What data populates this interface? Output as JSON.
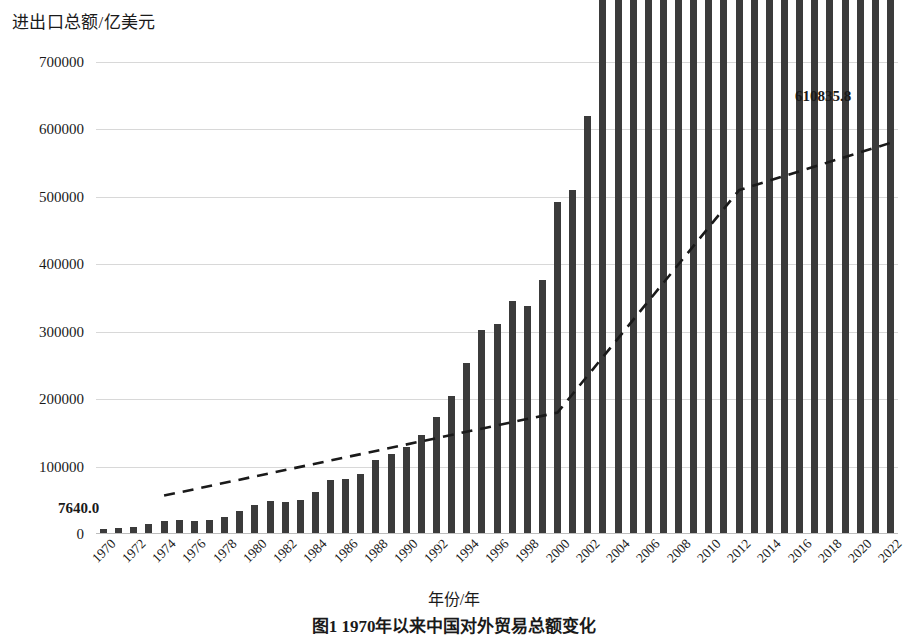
{
  "axis": {
    "y_title": "进出口总额/亿美元",
    "x_title": "年份/年",
    "y_ticks": [
      "0",
      "100000",
      "200000",
      "300000",
      "400000",
      "500000",
      "600000",
      "700000"
    ]
  },
  "annotations": {
    "first_value_label": "7640.0",
    "last_value_label": "610835.8"
  },
  "caption": "图1  1970年以来中国对外贸易总额变化",
  "colors": {
    "bar": "#3b3b3b",
    "trend": "#1a1a1a",
    "grid": "#d8d8d8"
  },
  "chart_data": {
    "type": "bar",
    "title": "",
    "xlabel": "年份/年",
    "ylabel": "进出口总额/亿美元",
    "ylim": [
      0,
      700000
    ],
    "grid": true,
    "legend": "none",
    "categories": [
      "1970",
      "1971",
      "1972",
      "1973",
      "1974",
      "1975",
      "1976",
      "1977",
      "1978",
      "1979",
      "1980",
      "1981",
      "1982",
      "1983",
      "1984",
      "1985",
      "1986",
      "1987",
      "1988",
      "1989",
      "1990",
      "1991",
      "1992",
      "1993",
      "1994",
      "1995",
      "1996",
      "1997",
      "1998",
      "1999",
      "2000",
      "2001",
      "2002",
      "2003",
      "2004",
      "2005",
      "2006",
      "2007",
      "2008",
      "2009",
      "2010",
      "2011",
      "2012",
      "2013",
      "2014",
      "2015",
      "2016",
      "2017",
      "2018",
      "2019",
      "2020",
      "2021",
      "2022"
    ],
    "tick_categories": [
      "1970",
      "1972",
      "1974",
      "1976",
      "1978",
      "1980",
      "1982",
      "1984",
      "1986",
      "1988",
      "1990",
      "1992",
      "1994",
      "1996",
      "1998",
      "2000",
      "2002",
      "2004",
      "2006",
      "2008",
      "2010",
      "2012",
      "2014",
      "2016",
      "2018",
      "2020",
      "2022"
    ],
    "series": [
      {
        "name": "进出口总额",
        "kind": "bar",
        "values": [
          7640,
          8140,
          10000,
          14700,
          19200,
          20100,
          19800,
          21300,
          25500,
          34000,
          43000,
          48600,
          47400,
          49800,
          61900,
          80500,
          81800,
          89500,
          109800,
          118000,
          129000,
          147000,
          174000,
          204000,
          253000,
          303000,
          311000,
          345000,
          338000,
          377000,
          492000,
          550000,
          672000,
          920000,
          1193000,
          1413000,
          1756000,
          2177000,
          2577000,
          2210000,
          2950000,
          3640000,
          3870000,
          4160000,
          4300000,
          3960000,
          3690000,
          4110000,
          4620000,
          4580000,
          4650000,
          6200000,
          6108358
        ],
        "values_display_unit": "亿美元",
        "values_plotted": [
          7640,
          8140,
          10000,
          14700,
          19200,
          20100,
          19800,
          21300,
          25500,
          34000,
          43000,
          48600,
          47400,
          49800,
          61900,
          80500,
          81800,
          89500,
          109800,
          118000,
          129000,
          147000,
          174000,
          204000,
          253000,
          303000,
          311000,
          345000,
          338000,
          377000,
          492000,
          510000,
          620000,
          850000,
          1150000,
          1420000,
          1760000,
          2170000,
          2560000,
          2210000,
          2970000,
          3640000,
          3870000,
          4160000,
          4300000,
          3960000,
          3690000,
          4110000,
          4620000,
          4580000,
          4650000,
          6200000,
          6108358
        ]
      },
      {
        "name": "趋势线",
        "kind": "line",
        "style": "dashed",
        "x": [
          "1974",
          "2000",
          "2012",
          "2022"
        ],
        "values": [
          57000,
          180000,
          510000,
          580000
        ]
      }
    ]
  },
  "bar_values": [
    7640,
    8140,
    10000,
    14700,
    19200,
    20100,
    19800,
    21300,
    25500,
    34000,
    43000,
    48600,
    47400,
    49800,
    61900,
    80500,
    81800,
    89500,
    109800,
    118000,
    129000,
    147000,
    174000,
    204000,
    253000,
    303000,
    311000,
    345000,
    338000,
    377000,
    492000,
    510000,
    620000,
    850000,
    1150000,
    1420000,
    1760000,
    2170000,
    2560000,
    2210000,
    2970000,
    3640000,
    3870000,
    4160000,
    4300000,
    3960000,
    3690000,
    4110000,
    4620000,
    4580000,
    4650000,
    6200000,
    6108358
  ],
  "bar_plot_heights": [
    7640,
    9000,
    10300,
    14700,
    19200,
    20100,
    19800,
    21300,
    25500,
    34000,
    43000,
    48600,
    47400,
    49800,
    61900,
    80500,
    81800,
    89500,
    109800,
    118000,
    129000,
    147000,
    174000,
    204000,
    253000,
    303000,
    311000,
    345000,
    338000,
    377000,
    492000,
    510000,
    620000,
    850000,
    1150000,
    1420000,
    1760000,
    2170000,
    2560000,
    2210000,
    2970000,
    3640000,
    3870000,
    4160000,
    4300000,
    3960000,
    3690000,
    4110000,
    4620000,
    4580000,
    4650000,
    6200000,
    6108358
  ]
}
